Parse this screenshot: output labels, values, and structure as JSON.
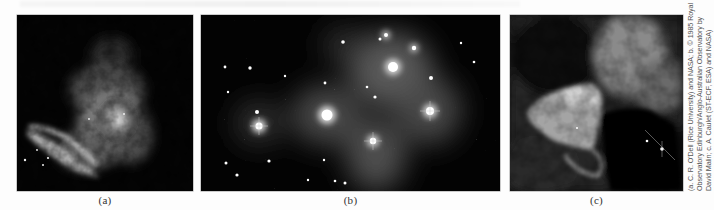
{
  "figure": {
    "panels": [
      {
        "id": "a",
        "label": "(a)",
        "subject": "emission nebula (Orion Nebula core)",
        "palette": "grayscale"
      },
      {
        "id": "b",
        "label": "(b)",
        "subject": "reflection nebula around star cluster (Pleiades)",
        "palette": "grayscale"
      },
      {
        "id": "c",
        "label": "(c)",
        "subject": "dark and bright nebula region",
        "palette": "grayscale"
      }
    ],
    "credit": {
      "lines": [
        "(a. C. R. O'Dell (Rice University) and NASA; b. © 1985 Royal",
        "Observatory Edinburgh/Anglo-Australian Observatory by",
        "David Malin; c. A. Caulet (ST-ECF, ESA) and NASA)"
      ],
      "orientation": "rotated-90-ccw"
    }
  },
  "colors": {
    "page_background": "#fdfdfd",
    "photo_background": "#050505",
    "label_text": "#333333",
    "credit_text": "#555555"
  }
}
